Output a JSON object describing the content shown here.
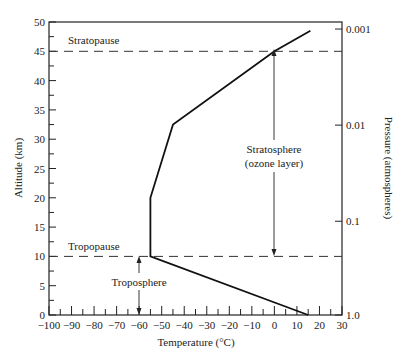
{
  "chart_data": {
    "type": "line",
    "title": "",
    "xlabel": "Temperature (°C)",
    "ylabel": "Altitude (km)",
    "y2label": "Pressure (atmospheres)",
    "xlim": [
      -100,
      30
    ],
    "ylim": [
      0,
      50
    ],
    "grid": false,
    "legend": null,
    "x_ticks": [
      -100,
      -90,
      -80,
      -70,
      -60,
      -50,
      -40,
      -30,
      -20,
      -10,
      0,
      10,
      20,
      30
    ],
    "x_tick_labels": [
      "−100",
      "−90",
      "−80",
      "−70",
      "−60",
      "−50",
      "−40",
      "−30",
      "−20",
      "−10",
      "0",
      "10",
      "20",
      "30"
    ],
    "y_ticks": [
      0,
      5,
      10,
      15,
      20,
      25,
      30,
      35,
      40,
      45,
      50
    ],
    "y_tick_labels": [
      "0",
      "5",
      "10",
      "15",
      "20",
      "25",
      "30",
      "35",
      "40",
      "45",
      "50"
    ],
    "y2_ticks": [
      {
        "label": "0.001",
        "altitude_km": 48.8
      },
      {
        "label": "0.01",
        "altitude_km": 32.4
      },
      {
        "label": "0.1",
        "altitude_km": 16.0
      },
      {
        "label": "1.0",
        "altitude_km": 0
      }
    ],
    "series": [
      {
        "name": "Temperature profile",
        "x": [
          15,
          -55,
          -55,
          -45,
          0,
          16
        ],
        "y": [
          0,
          10,
          20,
          32.5,
          45,
          48.5
        ]
      }
    ],
    "reference_lines": [
      {
        "label": "Stratopause",
        "altitude_km": 45,
        "style": "dashed"
      },
      {
        "label": "Tropopause",
        "altitude_km": 10,
        "style": "dashed"
      }
    ],
    "annotations": [
      {
        "text": "Stratosphere",
        "text2": "(ozone layer)",
        "x": 0,
        "y_range": [
          10,
          45
        ],
        "arrow": "double"
      },
      {
        "text": "Troposphere",
        "x": -60,
        "y_range": [
          0,
          10
        ],
        "arrow": "double"
      }
    ]
  },
  "labels": {
    "stratopause": "Stratopause",
    "tropopause": "Tropopause",
    "stratosphere": "Stratosphere",
    "ozone": "(ozone layer)",
    "troposphere": "Troposphere",
    "xlabel": "Temperature (°C)",
    "ylabel": "Altitude (km)",
    "y2label": "Pressure (atmospheres)"
  }
}
